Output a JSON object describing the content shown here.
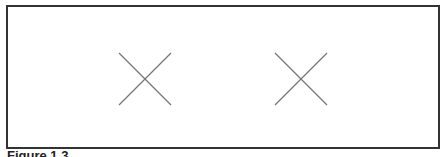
{
  "figure": {
    "caption": "Figure 1.3",
    "border_color": "#333333",
    "marks": [
      {
        "icon": "x-mark-icon",
        "x": 118,
        "y": 52,
        "size": 53,
        "color": "#777777"
      },
      {
        "icon": "x-mark-icon",
        "x": 274,
        "y": 52,
        "size": 53,
        "color": "#777777"
      }
    ]
  }
}
